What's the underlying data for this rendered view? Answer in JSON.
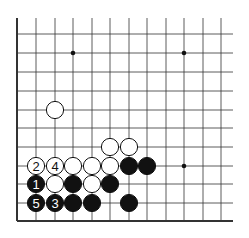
{
  "board": {
    "cols": [
      17,
      36,
      55,
      73,
      92,
      110,
      129,
      147,
      166,
      184,
      203,
      221
    ],
    "rows": [
      34,
      53,
      72,
      91,
      110,
      128,
      147,
      166,
      184,
      203,
      221
    ],
    "top_edge": 18,
    "right_end": 233,
    "stone_radius": 8.6
  },
  "star_points": [
    {
      "x": 73,
      "y": 53
    },
    {
      "x": 184,
      "y": 53
    },
    {
      "x": 184,
      "y": 166
    }
  ],
  "stones": [
    {
      "color": "white",
      "x": 55,
      "y": 110,
      "label": ""
    },
    {
      "color": "white",
      "x": 110,
      "y": 147,
      "label": ""
    },
    {
      "color": "white",
      "x": 129,
      "y": 147,
      "label": ""
    },
    {
      "color": "white",
      "x": 36,
      "y": 166,
      "label": "2"
    },
    {
      "color": "white",
      "x": 55,
      "y": 166,
      "label": "4"
    },
    {
      "color": "white",
      "x": 73,
      "y": 166,
      "label": ""
    },
    {
      "color": "white",
      "x": 92,
      "y": 166,
      "label": ""
    },
    {
      "color": "white",
      "x": 110,
      "y": 166,
      "label": ""
    },
    {
      "color": "black",
      "x": 129,
      "y": 166,
      "label": ""
    },
    {
      "color": "black",
      "x": 147,
      "y": 166,
      "label": ""
    },
    {
      "color": "black",
      "x": 36,
      "y": 184,
      "label": "1"
    },
    {
      "color": "white",
      "x": 55,
      "y": 184,
      "label": ""
    },
    {
      "color": "black",
      "x": 73,
      "y": 184,
      "label": ""
    },
    {
      "color": "white",
      "x": 92,
      "y": 184,
      "label": ""
    },
    {
      "color": "black",
      "x": 110,
      "y": 184,
      "label": ""
    },
    {
      "color": "black",
      "x": 36,
      "y": 203,
      "label": "5"
    },
    {
      "color": "black",
      "x": 55,
      "y": 203,
      "label": "3"
    },
    {
      "color": "black",
      "x": 73,
      "y": 203,
      "label": "3x"
    },
    {
      "color": "black",
      "x": 92,
      "y": 203,
      "label": ""
    },
    {
      "color": "black",
      "x": 129,
      "y": 203,
      "label": ""
    }
  ]
}
